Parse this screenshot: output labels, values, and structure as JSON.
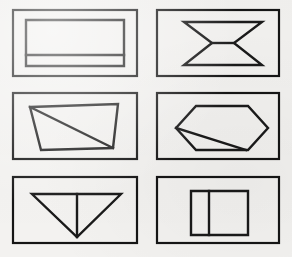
{
  "figure": {
    "title": "",
    "background_color": "#f3f2f0",
    "stroke_color": "#1a1a1a",
    "width": 292,
    "height": 257,
    "grid_rows": 3,
    "grid_cols": 2
  },
  "panels": [
    {
      "id": "panel-1",
      "position": "top-left",
      "row": 1,
      "col": 1,
      "shape_name": "rectangle-with-horizontal-divider",
      "frame": {
        "x": 13,
        "y": 10,
        "w": 124,
        "h": 66
      },
      "outline_points": "26,20 124,20 124,66 26,66",
      "internal_lines": [
        "26,55 124,55"
      ]
    },
    {
      "id": "panel-2",
      "position": "top-right",
      "row": 1,
      "col": 2,
      "shape_name": "hourglass-bowtie",
      "frame": {
        "x": 157,
        "y": 10,
        "w": 122,
        "h": 66
      },
      "outline_points": "184,22 262,22 234,43 262,65 184,65 212,43",
      "internal_lines": [
        "212,43 234,43"
      ]
    },
    {
      "id": "panel-3",
      "position": "middle-left",
      "row": 2,
      "col": 1,
      "shape_name": "trapezoid-with-diagonal",
      "frame": {
        "x": 13,
        "y": 93,
        "w": 124,
        "h": 66
      },
      "outline_points": "30,107 118,104 113,148 41,150",
      "internal_lines": [
        "30,107 113,148"
      ]
    },
    {
      "id": "panel-4",
      "position": "middle-right",
      "row": 2,
      "col": 2,
      "shape_name": "hexagon-with-chord",
      "frame": {
        "x": 157,
        "y": 93,
        "w": 122,
        "h": 66
      },
      "outline_points": "196,106 248,106 268,128 248,150 196,150 176,128",
      "internal_lines": [
        "176,128 246,150"
      ]
    },
    {
      "id": "panel-5",
      "position": "bottom-left",
      "row": 3,
      "col": 1,
      "shape_name": "inverted-triangle-with-median",
      "frame": {
        "x": 13,
        "y": 177,
        "w": 124,
        "h": 66
      },
      "outline_points": "32,194 121,194 77,237",
      "internal_lines": [
        "77,194 77,237"
      ]
    },
    {
      "id": "panel-6",
      "position": "bottom-right",
      "row": 3,
      "col": 2,
      "shape_name": "rectangle-with-vertical-divider",
      "frame": {
        "x": 157,
        "y": 177,
        "w": 122,
        "h": 66
      },
      "outline_points": "191,191 248,191 248,235 191,235",
      "internal_lines": [
        "209,191 209,235"
      ]
    }
  ]
}
